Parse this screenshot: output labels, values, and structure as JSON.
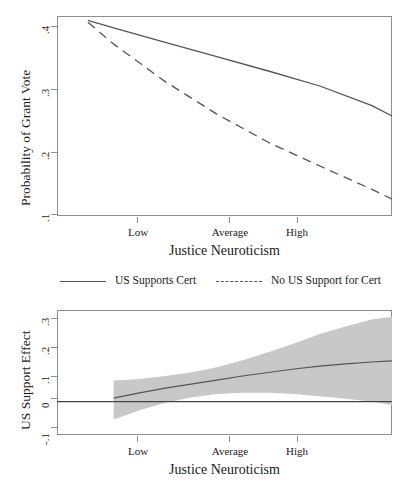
{
  "figure": {
    "background": "#ffffff",
    "line_color": "#555555",
    "band_color": "#c8c8c8",
    "frame_color": "#8e8e8e"
  },
  "legend": {
    "items": [
      {
        "label": "US Supports Cert",
        "style": "solid"
      },
      {
        "label": "No US Support for Cert",
        "style": "dashed"
      }
    ]
  },
  "chart_data": [
    {
      "type": "line",
      "panel": "top",
      "title": "",
      "xlabel": "Justice Neuroticism",
      "ylabel": "Probability of Grant Vote",
      "x_tick_labels": [
        "Low",
        "Average",
        "High"
      ],
      "x_tick_values": [
        1,
        2,
        3
      ],
      "y_tick_labels": [
        ".4",
        ".3",
        ".2",
        ".1"
      ],
      "y_tick_values": [
        0.4,
        0.3,
        0.2,
        0.1
      ],
      "ylim": [
        0.085,
        0.405
      ],
      "xlim": [
        0.45,
        3.7
      ],
      "grid": false,
      "legend_position": "below",
      "series": [
        {
          "name": "US Supports Cert",
          "style": "solid",
          "x": [
            0.75,
            1.0,
            1.5,
            2.0,
            2.5,
            3.0,
            3.5,
            3.7
          ],
          "values": [
            0.398,
            0.386,
            0.363,
            0.34,
            0.317,
            0.293,
            0.262,
            0.245
          ]
        },
        {
          "name": "No US Support for Cert",
          "style": "dashed",
          "x": [
            0.75,
            1.0,
            1.5,
            2.0,
            2.5,
            3.0,
            3.5,
            3.7
          ],
          "values": [
            0.395,
            0.36,
            0.3,
            0.248,
            0.203,
            0.165,
            0.128,
            0.112
          ]
        }
      ]
    },
    {
      "type": "line",
      "panel": "bottom",
      "title": "",
      "xlabel": "Justice Neuroticism",
      "ylabel": "US Support Effect",
      "x_tick_labels": [
        "Low",
        "Average",
        "High"
      ],
      "x_tick_values": [
        1,
        2,
        3
      ],
      "y_tick_labels": [
        ".3",
        ".2",
        ".1",
        "0",
        "-.1"
      ],
      "y_tick_values": [
        0.3,
        0.2,
        0.1,
        0.0,
        -0.1
      ],
      "ylim": [
        -0.115,
        0.315
      ],
      "xlim": [
        0.45,
        3.7
      ],
      "grid": false,
      "reference_line": {
        "y": 0.0,
        "style": "solid"
      },
      "series": [
        {
          "name": "US Support Effect",
          "style": "solid",
          "x": [
            1.0,
            1.25,
            1.5,
            1.75,
            2.0,
            2.25,
            2.5,
            2.75,
            3.0,
            3.25,
            3.5,
            3.7
          ],
          "values": [
            0.012,
            0.03,
            0.046,
            0.06,
            0.074,
            0.088,
            0.1,
            0.112,
            0.122,
            0.13,
            0.136,
            0.14
          ]
        }
      ],
      "confidence_band": {
        "name": "95% CI",
        "x": [
          1.0,
          1.25,
          1.5,
          1.75,
          2.0,
          2.25,
          2.5,
          2.75,
          3.0,
          3.25,
          3.5,
          3.7
        ],
        "upper": [
          0.072,
          0.078,
          0.088,
          0.1,
          0.118,
          0.142,
          0.17,
          0.2,
          0.232,
          0.258,
          0.282,
          0.292
        ],
        "lower": [
          -0.062,
          -0.03,
          -0.004,
          0.014,
          0.026,
          0.03,
          0.03,
          0.026,
          0.018,
          0.01,
          0.0,
          -0.012
        ]
      }
    }
  ]
}
